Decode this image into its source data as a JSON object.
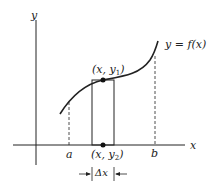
{
  "diagram": {
    "axes": {
      "x_label": "x",
      "y_label": "y"
    },
    "curve_label": "y = f(x)",
    "bounds": {
      "a": "a",
      "b": "b"
    },
    "top_point": {
      "label_x": "x",
      "label_y": "y",
      "label_sub": "1"
    },
    "bottom_point": {
      "label_x": "x",
      "label_y": "y",
      "label_sub": "2"
    },
    "width_label": "Δx",
    "colors": {
      "line": "#222222",
      "background": "#ffffff"
    }
  }
}
